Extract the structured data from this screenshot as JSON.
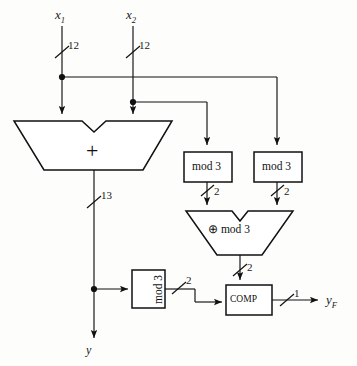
{
  "diagram": {
    "inputs": [
      {
        "name": "x1",
        "label": "x",
        "subscript": "1",
        "bus_width": "12"
      },
      {
        "name": "x2",
        "label": "x",
        "subscript": "2",
        "bus_width": "12"
      }
    ],
    "outputs": [
      {
        "name": "y",
        "label": "y",
        "subscript": ""
      },
      {
        "name": "yF",
        "label": "y",
        "subscript": "F",
        "bus_width": "1"
      }
    ],
    "blocks": [
      {
        "id": "adder",
        "label": "+",
        "shape": "trapezoid-notched"
      },
      {
        "id": "mod3-left",
        "label": "mod 3",
        "shape": "rect"
      },
      {
        "id": "mod3-right",
        "label": "mod 3",
        "shape": "rect"
      },
      {
        "id": "xor-mod3",
        "label": "⊕  mod 3",
        "shape": "trapezoid-notched"
      },
      {
        "id": "mod3-bottom",
        "label": "mod 3",
        "shape": "rect-rotated"
      },
      {
        "id": "comp",
        "label": "COMP",
        "shape": "rect"
      }
    ],
    "bus_labels": {
      "adder_output": "13",
      "mod3_left_out": "2",
      "mod3_right_out": "2",
      "xor_mod3_out": "2",
      "mod3_bottom_out": "2",
      "comp_out": "1"
    }
  }
}
